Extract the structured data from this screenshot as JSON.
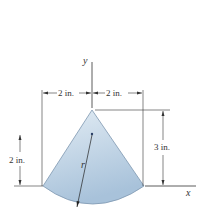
{
  "diagram": {
    "type": "sector-centroid-figure",
    "shape": "circular sector (cone-like wedge) with apex at top on y-axis",
    "fill_color_top": "#dbe7f1",
    "fill_color_bottom": "#a9c3dc",
    "labels": {
      "y_axis": "y",
      "x_axis": "x",
      "radius": "r",
      "left_width": "2 in.",
      "right_width": "2 in.",
      "height": "3 in.",
      "centroid_height": "2 in."
    }
  }
}
